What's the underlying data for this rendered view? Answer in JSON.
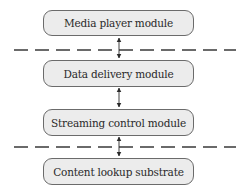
{
  "diagram": {
    "modules": [
      {
        "id": "media-player",
        "label": "Media player module",
        "top": 10
      },
      {
        "id": "data-delivery",
        "label": "Data delivery module",
        "top": 60
      },
      {
        "id": "streaming-control",
        "label": "Streaming control module",
        "top": 109
      },
      {
        "id": "content-lookup",
        "label": "Content lookup substrate",
        "top": 158
      }
    ],
    "separators": [
      {
        "id": "separator-1",
        "y": 50,
        "style": "dashed"
      },
      {
        "id": "separator-2",
        "y": 147,
        "style": "dashed"
      }
    ],
    "connections": [
      {
        "from": "media-player",
        "to": "data-delivery",
        "type": "bidirectional-arrow"
      },
      {
        "from": "data-delivery",
        "to": "streaming-control",
        "type": "bidirectional-arrow"
      },
      {
        "from": "streaming-control",
        "to": "content-lookup",
        "type": "bidirectional-arrow"
      }
    ],
    "colors": {
      "box_fill": "#ececec",
      "box_border": "#6b6b6b",
      "line": "#3a3a3a",
      "text": "#2a2a2a"
    }
  }
}
